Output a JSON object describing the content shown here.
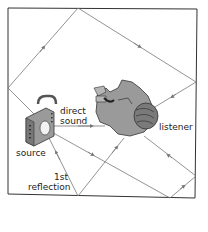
{
  "diagram": {
    "type": "room-acoustics-sound-paths",
    "labels": {
      "direct_line1": "direct",
      "direct_line2": "sound",
      "listener": "listener",
      "source": "source",
      "reflection_line1": "1st",
      "reflection_line2": "reflection"
    },
    "colors": {
      "room_border": "#333333",
      "ray": "#777777",
      "figure_fill": "#9a9a9a",
      "figure_dark": "#444444",
      "background": "#ffffff"
    }
  }
}
